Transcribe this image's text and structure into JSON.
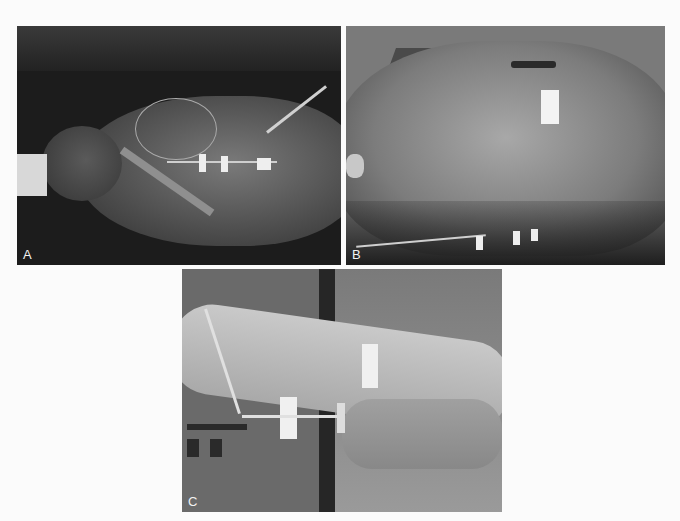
{
  "figure": {
    "panels": [
      {
        "id": "A",
        "label": "A",
        "subject": "horse in dorsal recumbency with jugular catheters and monitoring lines"
      },
      {
        "id": "B",
        "label": "B",
        "subject": "horse head with facial artery catheter and taped lines"
      },
      {
        "id": "C",
        "label": "C",
        "subject": "limb with catheter secured by white tape"
      }
    ],
    "caption": {
      "visible": "clipped",
      "text": ""
    }
  },
  "colors": {
    "background": "#fbfbfb",
    "photo_dark": "#1e1e1e",
    "photo_mid": "#6e6e6e",
    "photo_light": "#b5b5b5",
    "tape": "#f0f0f0",
    "label": "#f2f2f2"
  }
}
